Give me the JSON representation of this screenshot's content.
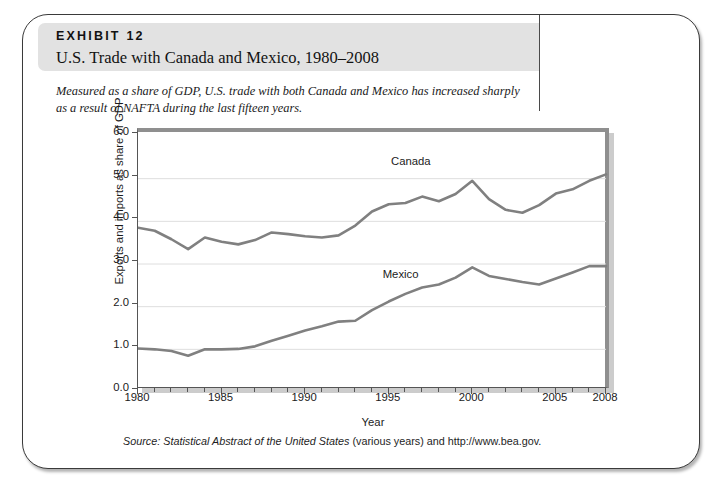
{
  "exhibit": {
    "label": "EXHIBIT 12",
    "title": "U.S. Trade with Canada and Mexico, 1980–2008",
    "caption": "Measured as a share of GDP, U.S. trade with both Canada and Mexico has increased sharply as a result of NAFTA during the last fifteen years.",
    "source_prefix": "Source: Statistical Abstract of the United States",
    "source_suffix": " (various years) and http://www.bea.gov."
  },
  "chart_data": {
    "type": "line",
    "title": "U.S. Trade with Canada and Mexico, 1980–2008",
    "xlabel": "Year",
    "ylabel": "Exports and imports as share of GDP",
    "xlim": [
      1980,
      2008
    ],
    "ylim": [
      0.0,
      6.0
    ],
    "ytick_labels": [
      "0.0",
      "1.0",
      "2.0",
      "3.0",
      "4.0",
      "5.0",
      "6.0"
    ],
    "yticks": [
      0.0,
      1.0,
      2.0,
      3.0,
      4.0,
      5.0,
      6.0
    ],
    "xtick_labels": [
      "1980",
      "1985",
      "1990",
      "1995",
      "2000",
      "2005",
      "2008"
    ],
    "xticks": [
      1980,
      1985,
      1990,
      1995,
      2000,
      2005,
      2008
    ],
    "minor_xtick_interval": 1,
    "grid": "horizontal",
    "legend_position": "inline-annotation",
    "line_color": "#808080",
    "grid_color": "#dedede",
    "x": [
      1980,
      1981,
      1982,
      1983,
      1984,
      1985,
      1986,
      1987,
      1988,
      1989,
      1990,
      1991,
      1992,
      1993,
      1994,
      1995,
      1996,
      1997,
      1998,
      1999,
      2000,
      2001,
      2002,
      2003,
      2004,
      2005,
      2006,
      2007,
      2008
    ],
    "series": [
      {
        "name": "Canada",
        "label_x": 1995.2,
        "label_y": 5.28,
        "values": [
          3.85,
          3.78,
          3.58,
          3.35,
          3.62,
          3.52,
          3.46,
          3.56,
          3.74,
          3.7,
          3.65,
          3.62,
          3.67,
          3.9,
          4.23,
          4.4,
          4.43,
          4.58,
          4.47,
          4.64,
          4.95,
          4.52,
          4.27,
          4.2,
          4.38,
          4.65,
          4.75,
          4.95,
          5.1
        ]
      },
      {
        "name": "Mexico",
        "label_x": 1994.7,
        "label_y": 2.62,
        "values": [
          1.02,
          1.0,
          0.96,
          0.85,
          1.0,
          1.0,
          1.01,
          1.07,
          1.2,
          1.32,
          1.44,
          1.54,
          1.65,
          1.67,
          1.92,
          2.12,
          2.3,
          2.45,
          2.52,
          2.68,
          2.92,
          2.72,
          2.65,
          2.58,
          2.52,
          2.66,
          2.8,
          2.95,
          2.95
        ]
      }
    ]
  }
}
